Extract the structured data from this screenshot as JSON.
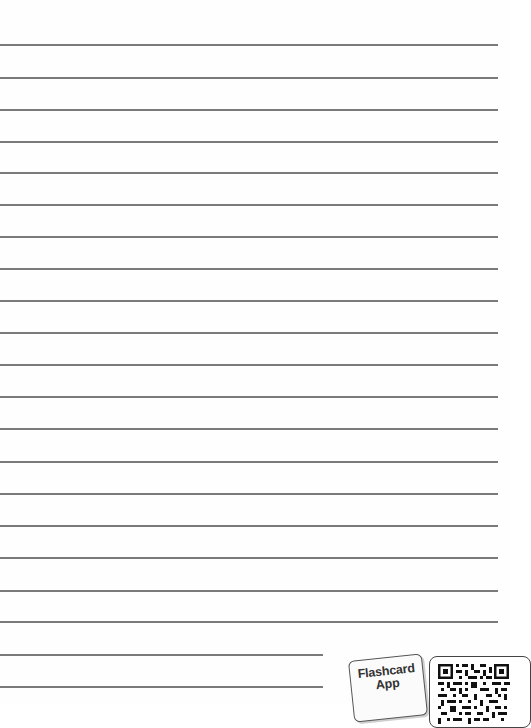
{
  "page": {
    "type": "lined-notebook-page",
    "line_color": "#7a7a7a",
    "lines": [
      {
        "y": 44,
        "x_end": 498
      },
      {
        "y": 77,
        "x_end": 498
      },
      {
        "y": 109,
        "x_end": 498
      },
      {
        "y": 141,
        "x_end": 498
      },
      {
        "y": 172,
        "x_end": 498
      },
      {
        "y": 204,
        "x_end": 498
      },
      {
        "y": 236,
        "x_end": 498
      },
      {
        "y": 268,
        "x_end": 498
      },
      {
        "y": 300,
        "x_end": 498
      },
      {
        "y": 332,
        "x_end": 498
      },
      {
        "y": 364,
        "x_end": 498
      },
      {
        "y": 396,
        "x_end": 498
      },
      {
        "y": 428,
        "x_end": 498
      },
      {
        "y": 461,
        "x_end": 498
      },
      {
        "y": 493,
        "x_end": 498
      },
      {
        "y": 525,
        "x_end": 498
      },
      {
        "y": 557,
        "x_end": 498
      },
      {
        "y": 590,
        "x_end": 498
      },
      {
        "y": 621,
        "x_end": 498
      },
      {
        "y": 654,
        "x_end": 323
      },
      {
        "y": 686,
        "x_end": 323
      }
    ]
  },
  "badge": {
    "line1": "Flashcard",
    "line2": "App"
  },
  "qr": {
    "icon": "qr-code-icon"
  }
}
